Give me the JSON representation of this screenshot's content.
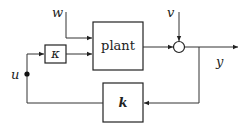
{
  "diagram": {
    "type": "feedback-control-block-diagram",
    "blocks": [
      {
        "id": "plant",
        "label": "plant"
      },
      {
        "id": "kappa",
        "label": "κ"
      },
      {
        "id": "controller",
        "label": "k"
      }
    ],
    "signals": {
      "w": "w",
      "v": "v",
      "y": "y",
      "u": "u"
    },
    "junctions": [
      {
        "id": "sum",
        "type": "summing-junction"
      },
      {
        "id": "u-node",
        "type": "branch-point"
      }
    ],
    "connections": [
      {
        "from": "w",
        "to": "plant"
      },
      {
        "from": "u-node",
        "to": "kappa"
      },
      {
        "from": "kappa",
        "to": "plant"
      },
      {
        "from": "plant",
        "to": "sum"
      },
      {
        "from": "v",
        "to": "sum"
      },
      {
        "from": "sum",
        "to": "y"
      },
      {
        "from": "y",
        "to": "controller"
      },
      {
        "from": "controller",
        "to": "u-node"
      }
    ]
  }
}
